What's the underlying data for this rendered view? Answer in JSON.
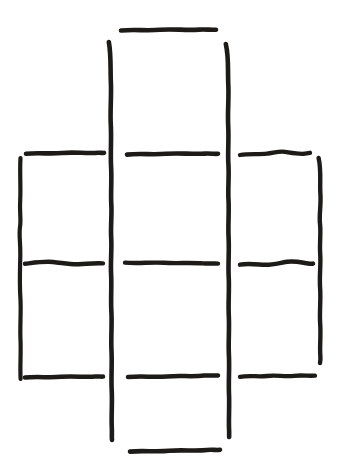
{
  "canvas": {
    "width": 342,
    "height": 476,
    "background_color": "#ffffff",
    "ink_color": "#1c1b19",
    "medium": "hand-drawn-marker-sketch",
    "description": "Hand-drawn sketch of an irregular grid / lattice figure made of four vertical strokes and nine horizontal strokes forming a ladder-like 3-column arrangement"
  },
  "figure": {
    "name": "hand-drawn-grid-figure",
    "vertical_stroke_count": 4,
    "horizontal_stroke_count": 9,
    "column_count": 3,
    "row_count": 4
  },
  "strokes": {
    "verticals": [
      {
        "name": "vertical-line-left-outer",
        "x": 20,
        "y_start": 158,
        "y_end": 379,
        "width": 4.2,
        "path": "M20.5,158 C19.6,172 20.9,186 20.2,200 C19.4,213 21.3,219 20.0,227 C18.8,235 20.6,243 20.3,256 C20.0,270 19.4,284 20.4,298 C21.3,312 19.8,326 20.5,340 C21.1,354 19.9,366 20.6,379"
      },
      {
        "name": "vertical-line-left-inner",
        "x": 111,
        "y_start": 42,
        "y_end": 440,
        "width": 4.6,
        "path": "M108.8,42 C111.3,55 110.2,69 110.9,83 C111.5,97 110.0,111 110.8,125 C111.6,139 110.3,153 111.1,167 C111.9,181 110.6,193 111.3,204 C112.0,215 110.5,226 111.2,238 C111.9,250 110.4,262 111.1,274 C111.8,286 110.6,299 111.4,312 C112.1,325 110.8,338 111.5,351 C112.2,364 111.0,377 111.7,390 C112.4,403 111.2,416 111.8,428 C112.1,434 111.6,437 112.0,440"
      },
      {
        "name": "vertical-line-right-inner",
        "x": 228,
        "y_start": 44,
        "y_end": 437,
        "width": 4.6,
        "path": "M225.8,44 C229.0,57 227.6,71 228.3,85 C229.0,99 227.4,112 228.2,126 C229.0,140 227.6,152 228.4,164 C229.2,176 227.8,188 228.5,200 C229.2,212 227.9,225 228.6,238 C229.3,251 228.0,264 228.7,277 C229.4,290 228.1,303 228.8,316 C229.5,329 228.2,342 228.9,355 C229.6,368 228.4,381 229.0,394 C229.6,407 228.5,419 229.1,430 C229.3,434 229.0,436 229.2,437"
      },
      {
        "name": "vertical-line-right-outer",
        "x": 320,
        "y_start": 158,
        "y_end": 363,
        "width": 4.4,
        "path": "M318.6,158 C321.5,170 319.6,182 320.4,194 C321.2,206 318.9,215 320.0,224 C321.1,233 319.4,243 320.2,254 C321.0,265 319.2,276 320.1,288 C321.0,300 319.3,312 320.2,324 C321.0,336 319.6,346 320.3,355 C320.7,360 320.2,361 320.0,363"
      }
    ],
    "horizontals": [
      {
        "name": "horizontal-line-top-center",
        "row": "top",
        "column": "center",
        "x_start": 121,
        "x_end": 216,
        "y": 30,
        "width": 4.6,
        "path": "M121,30.5 C134,29.2 147,31.0 160,29.8 C173,28.7 186,30.6 199,29.6 C206,29.1 211,30.2 216,29.7"
      },
      {
        "name": "horizontal-line-upper-left",
        "row": "upper",
        "column": "left",
        "x_start": 26,
        "x_end": 104,
        "y": 153,
        "width": 4.6,
        "path": "M26,153.8 C38,152.4 50,154.2 62,153.0 C74,151.9 86,153.6 98,152.8 C101,152.6 103,153.2 104,152.9"
      },
      {
        "name": "horizontal-line-upper-center",
        "row": "upper",
        "column": "center",
        "x_start": 127,
        "x_end": 218,
        "y": 154,
        "width": 4.6,
        "path": "M127,154.6 C140,153.2 153,155.0 166,153.8 C179,152.7 192,154.4 205,153.6 C210,153.3 215,154.1 218,153.8"
      },
      {
        "name": "horizontal-line-upper-right",
        "row": "upper",
        "column": "right",
        "x_start": 240,
        "x_end": 310,
        "y": 153,
        "width": 4.3,
        "path": "M240,155.0 C249,153.4 258,154.6 267,153.6 C274,152.8 279,150.9 285,151.8 C292,152.9 299,154.4 305,153.6 C307,153.3 309,153.0 310,152.8"
      },
      {
        "name": "horizontal-line-middle-left",
        "row": "middle",
        "column": "left",
        "x_start": 25,
        "x_end": 103,
        "y": 263,
        "width": 4.4,
        "path": "M25,263.8 C35,262.6 44,261.2 53,262.0 C62,262.8 70,264.6 79,264.2 C88,263.8 95,262.9 103,263.4"
      },
      {
        "name": "horizontal-line-middle-center",
        "row": "middle",
        "column": "center",
        "x_start": 125,
        "x_end": 218,
        "y": 263,
        "width": 4.4,
        "path": "M125,262.6 C138,263.8 151,262.0 164,262.8 C177,263.6 190,262.4 203,263.4 C209,263.9 214,263.2 218,263.6"
      },
      {
        "name": "horizontal-line-middle-right",
        "row": "middle",
        "column": "right",
        "x_start": 240,
        "x_end": 313,
        "y": 263,
        "width": 4.5,
        "path": "M240,264.6 C248,263.0 256,264.2 264,264.8 C272,265.4 279,263.0 287,261.8 C295,260.6 302,262.6 308,263.4 C310,263.7 312,263.9 313,263.6"
      },
      {
        "name": "horizontal-line-bottom-left",
        "row": "bottom",
        "column": "left",
        "x_start": 25,
        "x_end": 103,
        "y": 377,
        "width": 4.5,
        "path": "M25,377.6 C37,376.2 49,378.0 61,376.8 C73,375.7 85,377.4 95,376.6 C99,376.3 101,376.8 103,376.6"
      },
      {
        "name": "horizontal-line-bottom-center",
        "row": "bottom",
        "column": "center",
        "x_start": 128,
        "x_end": 218,
        "y": 376,
        "width": 4.5,
        "path": "M128,377.0 C141,375.8 154,377.4 167,376.4 C180,375.4 193,376.9 204,375.6 C209,375.0 214,376.0 218,375.4"
      },
      {
        "name": "horizontal-line-bottom-right",
        "row": "bottom",
        "column": "right",
        "x_start": 240,
        "x_end": 315,
        "y": 376,
        "width": 4.3,
        "path": "M240,376.8 C249,375.2 258,377.0 267,376.0 C276,375.0 285,376.8 294,375.8 C302,374.9 309,376.2 315,375.6"
      },
      {
        "name": "horizontal-line-bottom-outer-center",
        "row": "outer-bottom",
        "column": "center",
        "x_start": 130,
        "x_end": 220,
        "y": 451,
        "width": 4.6,
        "path": "M130,451.6 C143,450.2 156,452.2 169,450.8 C182,449.5 195,451.4 207,450.0 C212,449.4 217,450.4 220,449.8"
      }
    ]
  }
}
